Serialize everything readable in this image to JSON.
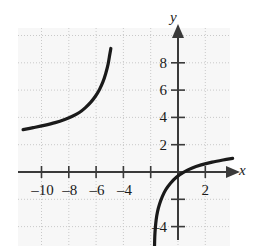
{
  "chart_data": {
    "type": "line",
    "title": "",
    "xlabel": "x",
    "ylabel": "y",
    "xlim": [
      -12.2,
      4.2
    ],
    "ylim": [
      -5.6,
      9.6
    ],
    "grid": true,
    "grid_style": "dotted",
    "grid_spacing": 2,
    "legend": null,
    "axis_arrows": [
      "x-positive",
      "y-positive"
    ],
    "xticks": [
      -10,
      -8,
      -6,
      -4,
      -2,
      2
    ],
    "xtick_labels": [
      "–10",
      "–8",
      "–6",
      "–4",
      "",
      "2"
    ],
    "yticks": [
      8,
      6,
      4,
      2,
      -2,
      -4
    ],
    "ytick_labels": [
      "8",
      "6",
      "4",
      "2",
      "",
      "–4"
    ],
    "asymptotes": [
      -5.0,
      -2.0
    ],
    "series": [
      {
        "name": "left-branch",
        "points": [
          [
            -11.35,
            3.1
          ],
          [
            -10.6,
            3.25
          ],
          [
            -9.8,
            3.42
          ],
          [
            -9.0,
            3.62
          ],
          [
            -8.3,
            3.85
          ],
          [
            -7.7,
            4.1
          ],
          [
            -7.2,
            4.38
          ],
          [
            -6.8,
            4.7
          ],
          [
            -6.4,
            5.1
          ],
          [
            -6.05,
            5.55
          ],
          [
            -5.75,
            6.05
          ],
          [
            -5.5,
            6.6
          ],
          [
            -5.3,
            7.2
          ],
          [
            -5.12,
            7.9
          ],
          [
            -5.0,
            8.6
          ],
          [
            -4.92,
            9.05
          ]
        ]
      },
      {
        "name": "right-branch",
        "points": [
          [
            -1.72,
            -5.45
          ],
          [
            -1.7,
            -4.7
          ],
          [
            -1.66,
            -4.1
          ],
          [
            -1.6,
            -3.5
          ],
          [
            -1.5,
            -2.9
          ],
          [
            -1.35,
            -2.35
          ],
          [
            -1.15,
            -1.8
          ],
          [
            -0.9,
            -1.3
          ],
          [
            -0.55,
            -0.82
          ],
          [
            -0.12,
            -0.38
          ],
          [
            0.4,
            -0.02
          ],
          [
            1.0,
            0.28
          ],
          [
            1.7,
            0.52
          ],
          [
            2.5,
            0.72
          ],
          [
            3.3,
            0.88
          ],
          [
            4.0,
            1.0
          ]
        ]
      }
    ],
    "colors": {
      "curve": "#1a1a1a",
      "axis": "#3a3a3a",
      "grid": "#c9c9c9",
      "plot_background": "#f7f7f7"
    }
  }
}
